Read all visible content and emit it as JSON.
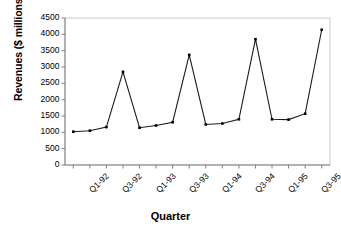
{
  "chart_data": {
    "type": "line",
    "title": "",
    "xlabel": "Quarter",
    "ylabel": "Revenues ($ millions)",
    "categories": [
      "Q1-92",
      "Q2-92",
      "Q3-92",
      "Q4-92",
      "Q1-93",
      "Q2-93",
      "Q3-93",
      "Q4-93",
      "Q1-94",
      "Q2-94",
      "Q3-94",
      "Q4-94",
      "Q1-95",
      "Q2-95",
      "Q3-95",
      "Q4-95"
    ],
    "values": [
      1020,
      1050,
      1160,
      2850,
      1140,
      1210,
      1310,
      3370,
      1240,
      1270,
      1400,
      3850,
      1400,
      1390,
      1570,
      4140
    ],
    "series": [
      {
        "name": "Revenues",
        "values": [
          1020,
          1050,
          1160,
          2850,
          1140,
          1210,
          1310,
          3370,
          1240,
          1270,
          1400,
          3850,
          1400,
          1390,
          1570,
          4140
        ]
      }
    ],
    "ylim": [
      0,
      4500
    ],
    "ytick_step": 500,
    "yticks": [
      "0",
      "500",
      "1000",
      "1500",
      "2000",
      "2500",
      "3000",
      "3500",
      "4000",
      "4500"
    ],
    "xtick_labels_visible": [
      "Q1-92",
      "Q3-92",
      "Q1-93",
      "Q3-93",
      "Q1-94",
      "Q3-94",
      "Q1-95",
      "Q3-95"
    ],
    "xtick_label_interval": 2,
    "xtick_label_rotation": -45,
    "grid": false,
    "legend": false,
    "legend_position": "none",
    "marker": "square",
    "line_color": "#1a1a1a",
    "marker_color": "#000000",
    "plot_border_color": "#cccccc",
    "axis_color": "#808080",
    "background_color": "#ffffff"
  }
}
